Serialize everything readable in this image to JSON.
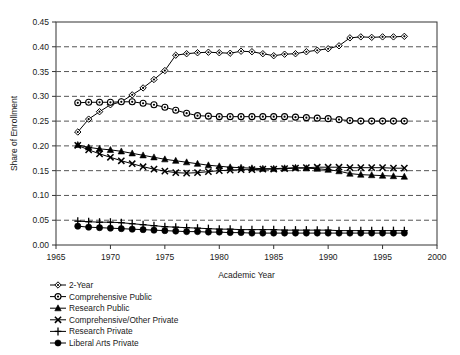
{
  "chart_data": {
    "type": "line",
    "title": "",
    "xlabel": "Academic Year",
    "ylabel": "Share of Enrollment",
    "xlim": [
      1965,
      2000
    ],
    "ylim": [
      0.0,
      0.45
    ],
    "xticks": [
      "1965",
      "1970",
      "1975",
      "1980",
      "1985",
      "1990",
      "1995",
      "2000"
    ],
    "yticks": [
      "0.00",
      "0.05",
      "0.10",
      "0.15",
      "0.20",
      "0.25",
      "0.30",
      "0.35",
      "0.40",
      "0.45"
    ],
    "grid": "horizontal-dashed",
    "legend_position": "below-left",
    "x": [
      1967,
      1968,
      1969,
      1970,
      1971,
      1972,
      1973,
      1974,
      1975,
      1976,
      1977,
      1978,
      1979,
      1980,
      1981,
      1982,
      1983,
      1984,
      1985,
      1986,
      1987,
      1988,
      1989,
      1990,
      1991,
      1992,
      1993,
      1994,
      1995,
      1996,
      1997
    ],
    "series": [
      {
        "name": "2-Year",
        "marker": "diamond",
        "values": [
          0.228,
          0.254,
          0.269,
          0.283,
          0.289,
          0.303,
          0.317,
          0.334,
          0.352,
          0.383,
          0.386,
          0.388,
          0.389,
          0.388,
          0.387,
          0.391,
          0.39,
          0.386,
          0.382,
          0.385,
          0.386,
          0.39,
          0.393,
          0.396,
          0.402,
          0.418,
          0.42,
          0.419,
          0.42,
          0.42,
          0.421
        ]
      },
      {
        "name": "Comprehensive Public",
        "marker": "circle-open",
        "values": [
          0.287,
          0.288,
          0.288,
          0.288,
          0.289,
          0.289,
          0.286,
          0.283,
          0.278,
          0.272,
          0.266,
          0.261,
          0.26,
          0.259,
          0.259,
          0.259,
          0.259,
          0.259,
          0.259,
          0.259,
          0.258,
          0.257,
          0.256,
          0.255,
          0.253,
          0.251,
          0.25,
          0.25,
          0.25,
          0.25,
          0.25
        ]
      },
      {
        "name": "Research Public",
        "marker": "triangle-filled",
        "values": [
          0.202,
          0.197,
          0.194,
          0.192,
          0.189,
          0.185,
          0.181,
          0.177,
          0.173,
          0.17,
          0.167,
          0.164,
          0.161,
          0.159,
          0.157,
          0.156,
          0.155,
          0.154,
          0.154,
          0.155,
          0.156,
          0.155,
          0.154,
          0.152,
          0.149,
          0.144,
          0.142,
          0.141,
          0.14,
          0.139,
          0.138
        ]
      },
      {
        "name": "Comprehensive/Other Private",
        "marker": "cross",
        "values": [
          0.201,
          0.192,
          0.184,
          0.177,
          0.17,
          0.164,
          0.158,
          0.153,
          0.149,
          0.146,
          0.145,
          0.146,
          0.148,
          0.15,
          0.151,
          0.152,
          0.152,
          0.153,
          0.153,
          0.154,
          0.155,
          0.156,
          0.157,
          0.157,
          0.157,
          0.156,
          0.156,
          0.156,
          0.156,
          0.155,
          0.155
        ]
      },
      {
        "name": "Research Private",
        "marker": "plus",
        "values": [
          0.048,
          0.047,
          0.046,
          0.046,
          0.045,
          0.043,
          0.041,
          0.039,
          0.037,
          0.036,
          0.035,
          0.034,
          0.033,
          0.032,
          0.032,
          0.031,
          0.031,
          0.031,
          0.031,
          0.03,
          0.03,
          0.03,
          0.03,
          0.03,
          0.029,
          0.029,
          0.029,
          0.029,
          0.029,
          0.029,
          0.029
        ]
      },
      {
        "name": "Liberal Arts Private",
        "marker": "circle-filled",
        "values": [
          0.038,
          0.036,
          0.035,
          0.034,
          0.033,
          0.032,
          0.031,
          0.03,
          0.029,
          0.028,
          0.027,
          0.027,
          0.026,
          0.026,
          0.025,
          0.025,
          0.024,
          0.024,
          0.024,
          0.024,
          0.024,
          0.024,
          0.024,
          0.024,
          0.024,
          0.024,
          0.024,
          0.024,
          0.024,
          0.024,
          0.024
        ]
      }
    ]
  },
  "legend": {
    "items": [
      {
        "label": "2-Year"
      },
      {
        "label": "Comprehensive Public"
      },
      {
        "label": "Research Public"
      },
      {
        "label": "Comprehensive/Other Private"
      },
      {
        "label": "Research Private"
      },
      {
        "label": "Liberal Arts Private"
      }
    ]
  },
  "colors": {
    "line": "#000000",
    "grid": "#555555",
    "axis": "#333333",
    "text": "#1a1a1a"
  }
}
